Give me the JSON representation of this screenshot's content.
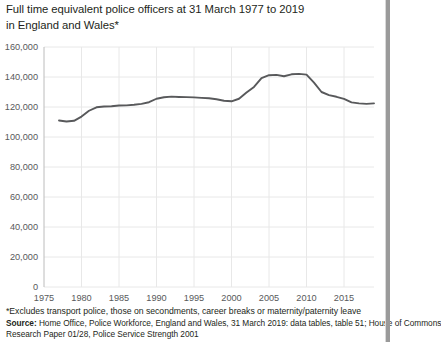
{
  "title": {
    "line1": "Full time equivalent police officers at 31 March 1977 to 2019",
    "line2": "in England and Wales*"
  },
  "footnotes": {
    "asterisk": "*Excludes transport police, those on secondments, career breaks or maternity/paternity leave",
    "source_label": "Source:",
    "source_text": " Home Office, Police Workforce, England and Wales, 31 March 2019: data tables, table 51; House of  Commons",
    "source_text2": "Research Paper 01/28, Police Service Strength 2001"
  },
  "colors": {
    "line": "#58595b",
    "grid": "#e8e8e8",
    "axis": "#bcbcbc",
    "text": "#231f20",
    "tick_text": "#58595b",
    "background": "#ffffff"
  },
  "chart_data": {
    "type": "line",
    "title": "Full time equivalent police officers at 31 March 1977 to 2019 in England and Wales*",
    "xlabel": "",
    "ylabel": "",
    "xlim": [
      1975,
      2019
    ],
    "ylim": [
      0,
      160000
    ],
    "grid": true,
    "legend": "none",
    "ytick_labels": [
      "0",
      "20,000",
      "40,000",
      "60,000",
      "80,000",
      "100,000",
      "120,000",
      "140,000",
      "160,000"
    ],
    "ytick_values": [
      0,
      20000,
      40000,
      60000,
      80000,
      100000,
      120000,
      140000,
      160000
    ],
    "xtick_labels": [
      "1975",
      "1980",
      "1985",
      "1990",
      "1995",
      "2000",
      "2005",
      "2010",
      "2015"
    ],
    "xtick_values": [
      1975,
      1980,
      1985,
      1990,
      1995,
      2000,
      2005,
      2010,
      2015
    ],
    "series": [
      {
        "name": "Full time equivalent police officers",
        "x": [
          1977,
          1978,
          1979,
          1980,
          1981,
          1982,
          1983,
          1984,
          1985,
          1986,
          1987,
          1988,
          1989,
          1990,
          1991,
          1992,
          1993,
          1994,
          1995,
          1996,
          1997,
          1998,
          1999,
          2000,
          2001,
          2002,
          2003,
          2004,
          2005,
          2006,
          2007,
          2008,
          2009,
          2010,
          2011,
          2012,
          2013,
          2014,
          2015,
          2016,
          2017,
          2018,
          2019
        ],
        "values": [
          111000,
          110300,
          110800,
          113600,
          117500,
          119800,
          120300,
          120500,
          121000,
          121100,
          121500,
          122100,
          123200,
          125500,
          126500,
          126900,
          126700,
          126600,
          126400,
          126100,
          125800,
          125200,
          124200,
          123800,
          125500,
          129600,
          133400,
          139200,
          141200,
          141400,
          140500,
          141800,
          142100,
          141600,
          136200,
          130000,
          127900,
          126800,
          125400,
          123100,
          122400,
          122100,
          122400
        ]
      }
    ],
    "annotations": []
  }
}
